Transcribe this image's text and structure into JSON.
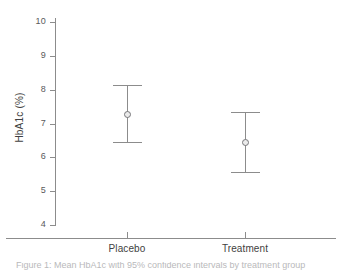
{
  "chart_data": {
    "type": "scatter",
    "title": "",
    "xlabel": "",
    "ylabel": "HbA1c (%)",
    "categories": [
      "Placebo",
      "Treatment"
    ],
    "values": [
      7.28,
      6.45
    ],
    "error_low": [
      6.45,
      5.56
    ],
    "error_high": [
      8.13,
      7.33
    ],
    "series": [
      {
        "name": "Mean HbA1c with 95% CI",
        "values": [
          7.28,
          6.45
        ],
        "error_low": [
          6.45,
          5.56
        ],
        "error_high": [
          8.13,
          7.33
        ]
      }
    ],
    "ylim": [
      3.7,
      10.3
    ],
    "yticks": [
      4,
      5,
      6,
      7,
      8,
      9,
      10
    ],
    "ytick_labels": [
      "4",
      "5",
      "6",
      "7",
      "8",
      "9",
      "10"
    ],
    "grid": false,
    "legend": "none",
    "marker": "open-circle",
    "colors": {
      "axis": "#8c8c8c",
      "errorbar": "#8c8c8c",
      "marker_edge": "#77777a",
      "marker_fill": "#ebebeb",
      "tick_label": "#59595b",
      "axis_title": "#3f3f41",
      "background": "#ffffff"
    }
  },
  "axis": {
    "y_title": "HbA1c (%)",
    "y_ticks": [
      {
        "label": "10",
        "value": 10
      },
      {
        "label": "9",
        "value": 9
      },
      {
        "label": "8",
        "value": 8
      },
      {
        "label": "7",
        "value": 7
      },
      {
        "label": "6",
        "value": 6
      },
      {
        "label": "5",
        "value": 5
      },
      {
        "label": "4",
        "value": 4
      }
    ],
    "x_ticks": [
      {
        "label": "Placebo"
      },
      {
        "label": "Treatment"
      }
    ]
  },
  "points": [
    {
      "group": "Placebo",
      "mean": "7.28",
      "lower": "6.45",
      "upper": "8.13"
    },
    {
      "group": "Treatment",
      "mean": "6.45",
      "lower": "5.56",
      "upper": "7.33"
    }
  ],
  "caption": {
    "text": "Figure 1: Mean HbA1c with 95% confidence intervals by treatment group"
  }
}
